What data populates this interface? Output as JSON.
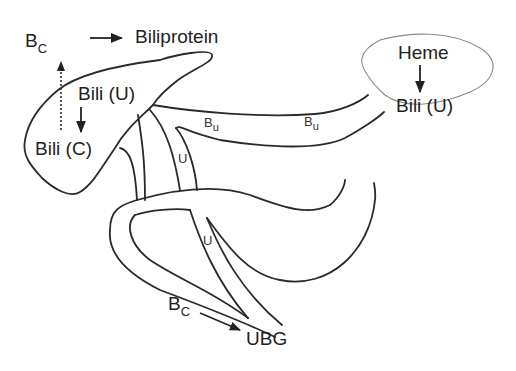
{
  "diagram": {
    "type": "bilirubin metabolism schematic",
    "nodes": {
      "bc_top": {
        "main": "B",
        "sub": "C"
      },
      "biliprotein": "Biliprotein",
      "bili_u_liver": "Bili (U)",
      "bili_c": "Bili (C)",
      "heme": "Heme",
      "bili_u_spleen": "Bili (U)",
      "bu_1": {
        "main": "B",
        "sub": "u"
      },
      "bu_2": {
        "main": "B",
        "sub": "u"
      },
      "u_1": "U",
      "u_2": "U",
      "bc_bottom": {
        "main": "B",
        "sub": "C"
      },
      "ubg": "UBG"
    },
    "arrows": [
      {
        "from": "Bc",
        "to": "Biliprotein",
        "style": "solid"
      },
      {
        "from": "Bili (U)",
        "to": "Bili (C)",
        "style": "solid"
      },
      {
        "from": "Bili (C)",
        "to": "Bc",
        "style": "dotted"
      },
      {
        "from": "Heme",
        "to": "Bili (U)",
        "style": "solid"
      },
      {
        "from": "Bc",
        "to": "UBG",
        "style": "solid"
      }
    ],
    "colors": {
      "line": "#2a2a2a",
      "outline": "#8a8a8a",
      "background": "#ffffff"
    }
  }
}
